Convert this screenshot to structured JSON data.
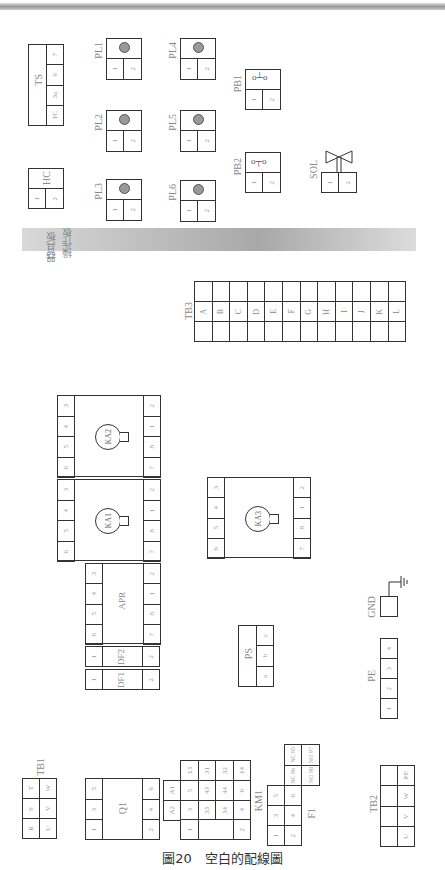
{
  "figure": {
    "caption": "圖20　空白的配線圖"
  },
  "sections": {
    "operation_panel": "操作板",
    "device_panel": "器具板"
  },
  "components": {
    "TS": {
      "label": "TS",
      "pins": [
        "1C",
        "3a",
        "6",
        "7"
      ]
    },
    "HC": {
      "label": "HC",
      "pins": [
        "1",
        "2"
      ]
    },
    "PL1": {
      "label": "PL1",
      "pins": [
        "1",
        "2"
      ]
    },
    "PL2": {
      "label": "PL2",
      "pins": [
        "1",
        "2"
      ]
    },
    "PL3": {
      "label": "PL3",
      "pins": [
        "1",
        "2"
      ]
    },
    "PL4": {
      "label": "PL4",
      "pins": [
        "1",
        "2"
      ]
    },
    "PL5": {
      "label": "PL5",
      "pins": [
        "1",
        "2"
      ]
    },
    "PL6": {
      "label": "PL6",
      "pins": [
        "1",
        "2"
      ]
    },
    "PB1": {
      "label": "PB1",
      "pins": [
        "1",
        "2"
      ]
    },
    "PB2": {
      "label": "PB2",
      "pins": [
        "1",
        "2"
      ]
    },
    "SOL": {
      "label": "SOL",
      "pins": [
        "1",
        "2"
      ]
    },
    "TB3": {
      "label": "TB3",
      "terminals": [
        "A",
        "B",
        "C",
        "D",
        "E",
        "F",
        "G",
        "H",
        "I",
        "J",
        "K",
        "L"
      ]
    },
    "KA2": {
      "label": "KA2",
      "left_pins": [
        "6",
        "5",
        "4",
        "3"
      ],
      "right_pins": [
        "7",
        "8",
        "1",
        "2"
      ]
    },
    "KA1": {
      "label": "KA1",
      "left_pins": [
        "6",
        "5",
        "4",
        "3"
      ],
      "right_pins": [
        "7",
        "8",
        "1",
        "2"
      ]
    },
    "KA3": {
      "label": "KA3",
      "left_pins": [
        "6",
        "5",
        "4",
        "3"
      ],
      "right_pins": [
        "7",
        "8",
        "1",
        "2"
      ]
    },
    "APR": {
      "label": "APR",
      "left_pins": [
        "6",
        "5",
        "4",
        "3"
      ],
      "right_pins": [
        "7",
        "8",
        "1",
        "2"
      ]
    },
    "DF2": {
      "label": "DF2",
      "pins": [
        "1",
        "2"
      ]
    },
    "DF1": {
      "label": "DF1",
      "pins": [
        "1",
        "2"
      ]
    },
    "PS": {
      "label": "PS",
      "pins": [
        "a",
        "b",
        "c"
      ]
    },
    "GND": {
      "label": "GND"
    },
    "PE": {
      "label": "PE",
      "pins": [
        "1",
        "2",
        "3",
        "4"
      ]
    },
    "TB1": {
      "label": "TB1",
      "left": [
        "R",
        "S",
        "T"
      ],
      "right": [
        "U",
        "V",
        "W"
      ]
    },
    "Q1": {
      "label": "Q1",
      "left": [
        "1",
        "3",
        "5"
      ],
      "right": [
        "2",
        "4",
        "6"
      ]
    },
    "KM1": {
      "label": "KM1",
      "coil": [
        "A2",
        "A1"
      ],
      "col1": [
        "1",
        "3",
        "5",
        "13"
      ],
      "col2": [
        "33",
        "43",
        "31"
      ],
      "col3": [
        "34",
        "44",
        "32"
      ],
      "col4": [
        "2",
        "4",
        "6",
        "14"
      ]
    },
    "F1": {
      "label": "F1",
      "left": [
        "1",
        "3",
        "5"
      ],
      "right": [
        "2",
        "4",
        "6"
      ],
      "contacts": [
        "NC 95",
        "NC 96",
        "NO 97",
        "NO 98"
      ]
    },
    "TB2": {
      "label": "TB2",
      "terminals": [
        "U",
        "V",
        "W",
        "PE"
      ]
    }
  }
}
